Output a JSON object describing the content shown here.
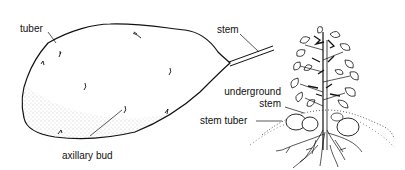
{
  "diagram": {
    "colors": {
      "line": "#111111",
      "stipple": "#777777",
      "background": "#ffffff"
    },
    "labels": {
      "tuber": "tuber",
      "stem": "stem",
      "axillary_bud": "axillary bud",
      "underground_stem_line1": "underground",
      "underground_stem_line2": "stem",
      "stem_tuber": "stem tuber"
    }
  }
}
